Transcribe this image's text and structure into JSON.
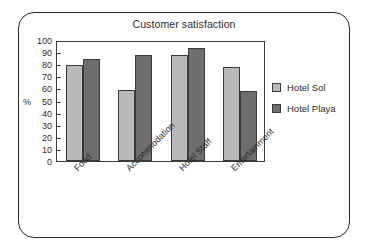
{
  "chart_data": {
    "type": "bar",
    "title": "Customer satisfaction",
    "xlabel": "",
    "ylabel": "%",
    "ylim": [
      0,
      100
    ],
    "ytick_values": [
      0,
      10,
      20,
      30,
      40,
      50,
      60,
      70,
      80,
      90,
      100
    ],
    "ytick_labels": [
      "0",
      "10",
      "20",
      "30",
      "40",
      "50",
      "60",
      "70",
      "80",
      "90",
      "100"
    ],
    "grid": false,
    "legend_position": "right",
    "categories": [
      "Food",
      "Accommodation",
      "Hotel Staff",
      "Entertainment"
    ],
    "series": [
      {
        "name": "Hotel Sol",
        "color": "#b9b9b9",
        "values": [
          79,
          59,
          88,
          78
        ]
      },
      {
        "name": "Hotel Playa",
        "color": "#6e6e6e",
        "values": [
          84,
          88,
          93,
          58
        ]
      }
    ]
  },
  "colors": {
    "frame": "#2b2b2b",
    "axis": "#3a3a3a",
    "text": "#2b2b2b",
    "series_light": "#b9b9b9",
    "series_dark": "#6e6e6e",
    "background": "#ffffff"
  }
}
